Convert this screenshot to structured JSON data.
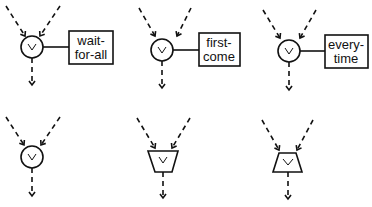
{
  "diagram": {
    "top_row": [
      {
        "symbol": "v",
        "shape": "circle",
        "label_line1": "wait-",
        "label_line2": "for-all"
      },
      {
        "symbol": "v",
        "shape": "circle",
        "label_line1": "first-",
        "label_line2": "come"
      },
      {
        "symbol": "v",
        "shape": "circle",
        "label_line1": "every-",
        "label_line2": "time"
      }
    ],
    "bottom_row": [
      {
        "symbol": "v",
        "shape": "circle"
      },
      {
        "symbol": "v",
        "shape": "trapezoid-down"
      },
      {
        "symbol": "v",
        "shape": "trapezoid-up"
      }
    ],
    "colors": {
      "stroke": "#111111",
      "background": "#ffffff"
    }
  }
}
